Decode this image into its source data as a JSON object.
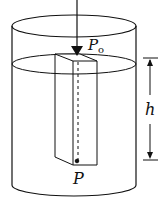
{
  "diagram": {
    "labels": {
      "surface_pressure": "P",
      "surface_pressure_sub": "o",
      "depth_pressure": "P",
      "depth": "h"
    },
    "colors": {
      "stroke": "#111111",
      "background": "#ffffff"
    }
  }
}
